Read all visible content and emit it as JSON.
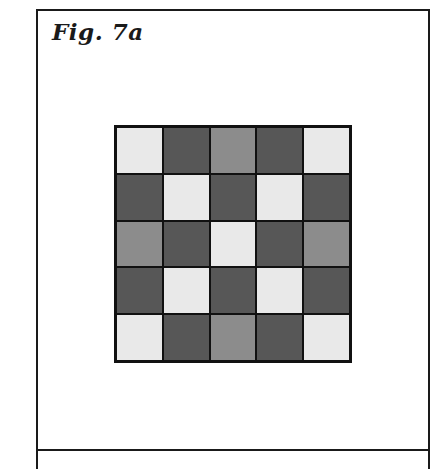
{
  "figure": {
    "label": "Fig. 7a"
  },
  "colors": {
    "L": "#e9e9e9",
    "D": "#575757",
    "M": "#8c8c8c",
    "border": "#111111"
  },
  "grid": {
    "rows": 5,
    "cols": 5,
    "cells": [
      [
        "L",
        "D",
        "M",
        "D",
        "L"
      ],
      [
        "D",
        "L",
        "D",
        "L",
        "D"
      ],
      [
        "M",
        "D",
        "L",
        "D",
        "M"
      ],
      [
        "D",
        "L",
        "D",
        "L",
        "D"
      ],
      [
        "L",
        "D",
        "M",
        "D",
        "L"
      ]
    ]
  }
}
